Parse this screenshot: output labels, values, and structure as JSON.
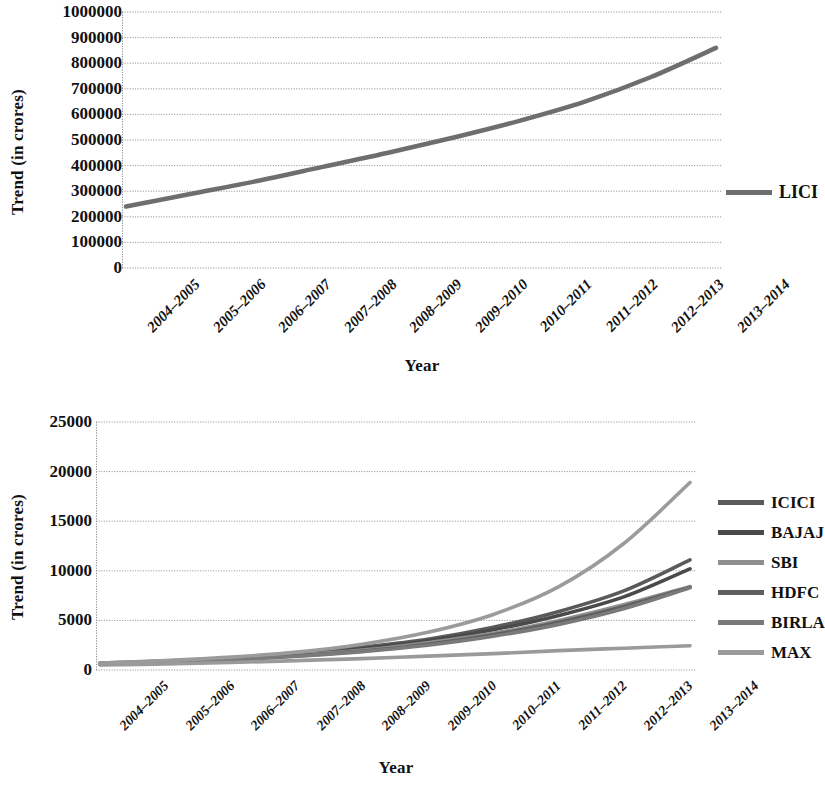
{
  "figure": {
    "background": "#ffffff",
    "axis_color": "#8a8a8a",
    "grid_color": "#9a9a9a",
    "text_color": "#111111"
  },
  "charts": [
    {
      "id": "lici-trend-chart",
      "type": "line",
      "title": "",
      "xlabel": "Year",
      "ylabel": "Trend (in crores)",
      "ylim": [
        0,
        1000000
      ],
      "ytick_step": 100000,
      "ytick_labels": [
        "1000000",
        "900000",
        "800000",
        "700000",
        "600000",
        "500000",
        "400000",
        "300000",
        "200000",
        "100000",
        "0"
      ],
      "categories": [
        "2004–2005",
        "2005–2006",
        "2006–2007",
        "2007–2008",
        "2008–2009",
        "2009–2010",
        "2010–2011",
        "2011–2012",
        "2012–2013",
        "2013–2014"
      ],
      "grid": true,
      "legend_position": "right",
      "series": [
        {
          "name": "LICI",
          "color": "#6e6e6e",
          "values": [
            240000,
            290000,
            340000,
            395000,
            450000,
            510000,
            575000,
            650000,
            745000,
            860000
          ]
        }
      ]
    },
    {
      "id": "private-insurers-trend-chart",
      "type": "line",
      "title": "",
      "xlabel": "Year",
      "ylabel": "Trend (in crores)",
      "ylim": [
        0,
        25000
      ],
      "ytick_step": 5000,
      "ytick_labels": [
        "25000",
        "20000",
        "15000",
        "10000",
        "5000",
        "0"
      ],
      "categories": [
        "2004–2005",
        "2005–2006",
        "2006–2007",
        "2007–2008",
        "2008–2009",
        "2009–2010",
        "2010–2011",
        "2011–2012",
        "2012–2013",
        "2013–2014"
      ],
      "grid": true,
      "legend_position": "right",
      "series": [
        {
          "name": "ICICI",
          "color": "#5a5a5a",
          "values": [
            700,
            900,
            1200,
            1650,
            2300,
            3100,
            4300,
            5900,
            8000,
            11100
          ]
        },
        {
          "name": "BAJAJ",
          "color": "#4a4a4a",
          "values": [
            650,
            850,
            1150,
            1550,
            2150,
            2950,
            4050,
            5500,
            7400,
            10200
          ]
        },
        {
          "name": "SBI",
          "color": "#8f8f8f",
          "values": [
            600,
            820,
            1100,
            1500,
            2000,
            2750,
            3700,
            5000,
            6600,
            8400
          ]
        },
        {
          "name": "HDFC",
          "color": "#5f5f5f",
          "values": [
            600,
            800,
            1050,
            1420,
            1900,
            2600,
            3550,
            4800,
            6400,
            8350
          ]
        },
        {
          "name": "BIRLA",
          "color": "#7a7a7a",
          "values": [
            550,
            750,
            1000,
            1380,
            1850,
            2500,
            3400,
            4600,
            6200,
            8300
          ]
        },
        {
          "name": "MAX",
          "color": "#9a9a9a",
          "values": [
            500,
            600,
            750,
            950,
            1150,
            1400,
            1650,
            1950,
            2200,
            2450
          ]
        }
      ],
      "highlight_series": {
        "name": "SBI",
        "note": "steepest upper curve reaching about 19000"
      },
      "upper_curve_values": [
        700,
        950,
        1300,
        1800,
        2600,
        3800,
        5600,
        8400,
        12800,
        18900
      ]
    }
  ]
}
